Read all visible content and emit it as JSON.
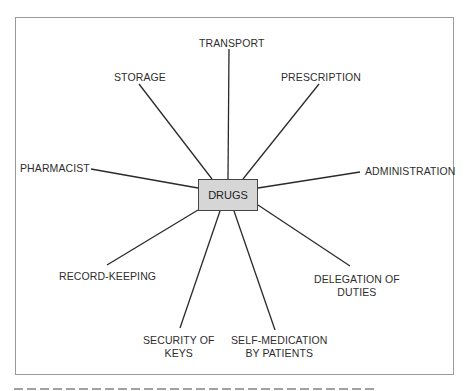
{
  "diagram": {
    "type": "spray-diagram",
    "center": {
      "label": "DRUGS",
      "fill": "#d6d6d6"
    },
    "branches": [
      {
        "id": "transport",
        "label": "TRANSPORT"
      },
      {
        "id": "prescription",
        "label": "PRESCRIPTION"
      },
      {
        "id": "administration",
        "label": "ADMINISTRATION"
      },
      {
        "id": "delegation",
        "label": "DELEGATION OF\nDUTIES",
        "line1": "DELEGATION OF",
        "line2": "DUTIES"
      },
      {
        "id": "self-medication",
        "label": "SELF-MEDICATION\nBY PATIENTS",
        "line1": "SELF-MEDICATION",
        "line2": "BY PATIENTS"
      },
      {
        "id": "security",
        "label": "SECURITY OF\nKEYS",
        "line1": "SECURITY OF",
        "line2": "KEYS"
      },
      {
        "id": "record-keeping",
        "label": "RECORD-KEEPING"
      },
      {
        "id": "pharmacist",
        "label": "PHARMACIST"
      },
      {
        "id": "storage",
        "label": "STORAGE"
      }
    ],
    "colors": {
      "line": "#2a2a2a",
      "frame": "#9a9a9a",
      "text": "#2e2e2e"
    }
  }
}
